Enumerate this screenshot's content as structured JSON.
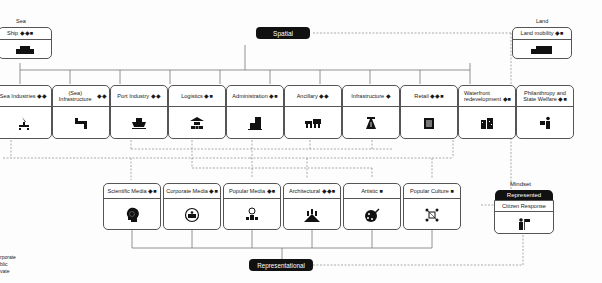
{
  "top_labels": {
    "sea": "Sea",
    "land": "Land"
  },
  "spatial": {
    "label": "Spatial"
  },
  "representational": {
    "label": "Representational"
  },
  "sea_box": {
    "title": "Ship",
    "marks": "◆◆■",
    "icon": "ship-icon"
  },
  "land_box": {
    "title": "Land mobility",
    "marks": "◆■",
    "icon": "truck-icon"
  },
  "spatial_items": [
    {
      "title": "Sea Industries",
      "marks": "◆◆",
      "icon": "oil-platform-icon"
    },
    {
      "title": "(Sea) Infrastructure",
      "marks": "◆◆",
      "icon": "pipe-icon"
    },
    {
      "title": "Port Industry",
      "marks": "◆◆",
      "icon": "cargo-ship-icon"
    },
    {
      "title": "Logistics",
      "marks": "◆■",
      "icon": "warehouse-icon"
    },
    {
      "title": "Administration",
      "marks": "◆■",
      "icon": "office-building-icon"
    },
    {
      "title": "Ancillary",
      "marks": "◆◆",
      "icon": "shops-icon"
    },
    {
      "title": "Infrastructure",
      "marks": "◆",
      "icon": "highway-icon"
    },
    {
      "title": "Retail",
      "marks": "◆◆■",
      "icon": "store-icon"
    },
    {
      "title": "Waterfront redevelopment",
      "marks": "◆■",
      "icon": "apartments-icon"
    },
    {
      "title": "Philanthropy and State Welfare",
      "marks": "◆■",
      "icon": "charity-icon"
    }
  ],
  "media_items": [
    {
      "title": "Scientific Media",
      "marks": "◆■",
      "icon": "brain-head-icon"
    },
    {
      "title": "Corporate Media",
      "marks": "◆■",
      "icon": "group-circle-icon"
    },
    {
      "title": "Popular Media",
      "marks": "◆■",
      "icon": "globe-person-icon"
    },
    {
      "title": "Architectural",
      "marks": "◆◆■",
      "icon": "skyline-icon"
    },
    {
      "title": "Artistic",
      "marks": "■",
      "icon": "palette-icon"
    },
    {
      "title": "Popular Culture",
      "marks": "■",
      "icon": "network-icon"
    }
  ],
  "mindset": {
    "label": "Mindset",
    "represented": "Represented",
    "box_title": "Citizen Response",
    "icon": "person-flag-icon"
  },
  "legend": {
    "items": [
      "rporate",
      "blic",
      "vate"
    ]
  }
}
